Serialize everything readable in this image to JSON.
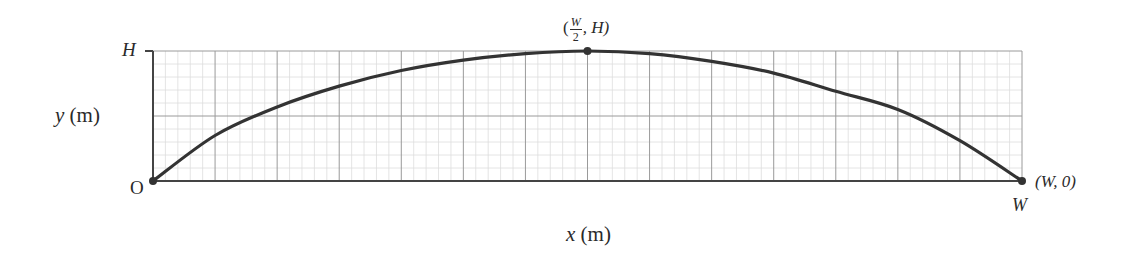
{
  "chart_data": {
    "type": "line",
    "title": "",
    "xlabel": "x (m)",
    "ylabel": "y (m)",
    "x_tick_labels": {
      "0": "O",
      "1": "W"
    },
    "y_tick_labels": {
      "1": "H"
    },
    "xlim": [
      0,
      1
    ],
    "ylim": [
      0,
      1
    ],
    "grid": {
      "on": true,
      "major_x_divisions": 14,
      "major_y_divisions": 2,
      "minor_per_major": 5
    },
    "series": [
      {
        "name": "trajectory",
        "x": [
          0,
          0.0714,
          0.1429,
          0.2143,
          0.2857,
          0.3571,
          0.4286,
          0.5,
          0.5714,
          0.6429,
          0.7143,
          0.7857,
          0.8571,
          0.9286,
          1
        ],
        "y": [
          0,
          0.35,
          0.57,
          0.73,
          0.85,
          0.93,
          0.98,
          1.0,
          0.98,
          0.92,
          0.83,
          0.69,
          0.55,
          0.31,
          0
        ]
      }
    ],
    "annotations": [
      {
        "point": [
          0,
          0
        ],
        "label": "O"
      },
      {
        "point": [
          0.5,
          1
        ],
        "label": "(W/2, H)"
      },
      {
        "point": [
          1,
          0
        ],
        "label": "(W, 0)"
      }
    ]
  },
  "labels": {
    "y_axis": "y (m)",
    "x_axis": "x (m)",
    "origin": "O",
    "H_tick": "H",
    "W_tick": "W",
    "peak_open": "(",
    "peak_num": "W",
    "peak_den": "2",
    "peak_rest": ", H)",
    "end_point": "(W, 0)"
  },
  "colors": {
    "curve": "#333333",
    "axis": "#444444",
    "major_grid": "#9a9a9a",
    "minor_grid": "#dddddd"
  },
  "geometry": {
    "x0": 153,
    "x1": 1022,
    "y0": 181,
    "y1": 51
  }
}
